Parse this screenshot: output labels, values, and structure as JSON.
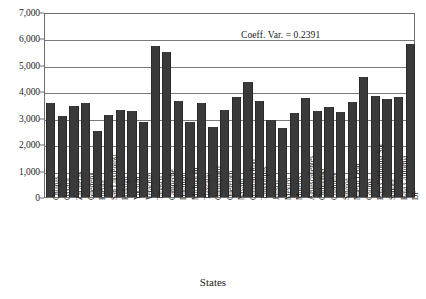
{
  "chart_data": {
    "type": "bar",
    "title": "",
    "xlabel": "States",
    "ylabel": "",
    "ylim": [
      0,
      7000
    ],
    "ytick_labels": [
      "0",
      "1,000",
      "2,000",
      "3,000",
      "4,000",
      "5,000",
      "6,000",
      "7,000"
    ],
    "ytick_values": [
      0,
      1000,
      2000,
      3000,
      4000,
      5000,
      6000,
      7000
    ],
    "grid": true,
    "legend": "none",
    "annotations": [
      {
        "text": "Coeff. Var. = 0.2391",
        "position": "top-right-inside-plot"
      }
    ],
    "bar_color": "#3a3a3a",
    "categories": [
      "Chiapas",
      "Oaxaca",
      "Zacatecas",
      "Guerrero",
      "Puebla",
      "San Luis Potosí",
      "Hidalgo",
      "Yucatán",
      "Veracruz",
      "Tabasco",
      "Campeche",
      "Durango",
      "Michoacán",
      "Tlaxcala",
      "Guanajuato",
      "Querétaro",
      "Nayarit",
      "Quintana Roo",
      "Tamaulipas",
      "Jalisco",
      "México",
      "Morelos",
      "Aguascalientes",
      "Chihuahua",
      "Coahuila",
      "Sinaloa",
      "Nuevo León",
      "Colima",
      "Baja California Sur",
      "Sonora",
      "Baja California",
      "DF"
    ],
    "values": [
      3540,
      3060,
      3430,
      3550,
      2490,
      3100,
      3290,
      3260,
      2840,
      5720,
      5500,
      3620,
      2850,
      3560,
      2660,
      3290,
      3780,
      4340,
      3620,
      2930,
      2600,
      3180,
      3730,
      3250,
      3400,
      3210,
      3590,
      4550,
      3810,
      3710,
      3790,
      5800
    ]
  },
  "axis": {
    "x_title": "States"
  }
}
